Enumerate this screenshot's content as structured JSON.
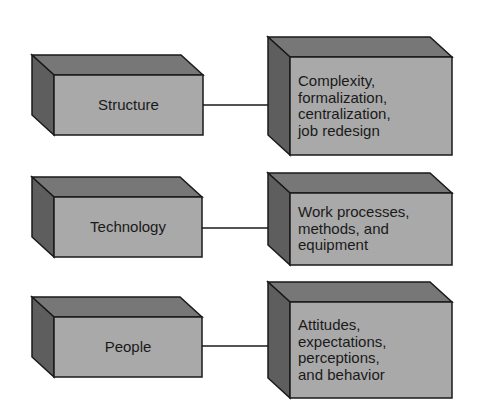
{
  "diagram": {
    "rows": [
      {
        "source": "Structure",
        "target": "Complexity,\nformalization,\ncentralization,\njob redesign"
      },
      {
        "source": "Technology",
        "target": "Work processes,\nmethods, and\nequipment"
      },
      {
        "source": "People",
        "target": "Attitudes,\nexpectations,\nperceptions,\nand behavior"
      }
    ],
    "colors": {
      "front_face": "#a9a9a9",
      "top_face": "#777777",
      "side_face": "#5e5e5e",
      "stroke": "#1a1a1a"
    }
  }
}
